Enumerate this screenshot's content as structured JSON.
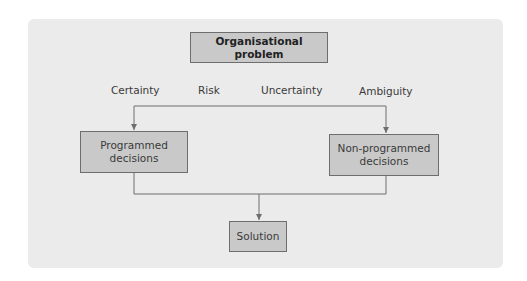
{
  "diagram": {
    "title_box": "Organisational problem",
    "conditions": [
      "Certainty",
      "Risk",
      "Uncertainty",
      "Ambiguity"
    ],
    "left_box": {
      "line1": "Programmed",
      "line2": "decisions"
    },
    "right_box": {
      "line1": "Non-programmed",
      "line2": "decisions"
    },
    "bottom_box": "Solution"
  },
  "colors": {
    "panel_bg": "#ebebeb",
    "box_fill": "#c9c9c9",
    "box_border": "#6e6e6e",
    "line": "#6e6e6e",
    "text": "#3a3a3a"
  }
}
